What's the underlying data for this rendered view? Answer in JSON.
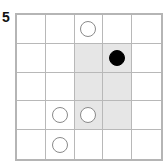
{
  "puzzle_label": "5",
  "board": {
    "rows": 5,
    "cols": 5,
    "shaded_cells": [
      [
        1,
        2
      ],
      [
        1,
        3
      ],
      [
        2,
        2
      ],
      [
        2,
        3
      ],
      [
        3,
        2
      ],
      [
        3,
        3
      ]
    ],
    "stones": [
      {
        "row": 0,
        "col": 2,
        "color": "white"
      },
      {
        "row": 1,
        "col": 3,
        "color": "black"
      },
      {
        "row": 3,
        "col": 1,
        "color": "white"
      },
      {
        "row": 3,
        "col": 2,
        "color": "white"
      },
      {
        "row": 4,
        "col": 1,
        "color": "white"
      }
    ]
  },
  "colors": {
    "shade": "#e6e6e6",
    "grid": "#b8b8b8",
    "black_stone": "#000000",
    "white_stone_outline": "#8a8a8a"
  }
}
